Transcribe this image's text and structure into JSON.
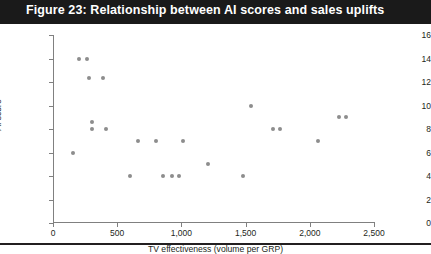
{
  "title": "Figure 23: Relationship between AI scores and sales uplifts",
  "colors": {
    "title_bar": "#1a1a1a",
    "title_text": "#ffffff",
    "point": "#8d8d8d",
    "axis": "#808080",
    "text": "#231f20",
    "rule": "#231f20"
  },
  "chart_data": {
    "type": "scatter",
    "title": "Figure 23: Relationship between AI scores and sales uplifts",
    "xlabel": "TV effectiveness (volume per GRP)",
    "ylabel": "AI score",
    "xlim": [
      0,
      2500
    ],
    "ylim": [
      0,
      16
    ],
    "xticks": [
      0,
      500,
      1000,
      1500,
      2000,
      2500
    ],
    "xtick_labels": [
      "0",
      "500",
      "1,000",
      "1,500",
      "2,000",
      "2,500"
    ],
    "yticks": [
      0,
      2,
      4,
      6,
      8,
      10,
      12,
      14,
      16
    ],
    "ytick_labels": [
      "0",
      "2",
      "4",
      "6",
      "8",
      "10",
      "12",
      "14",
      "16"
    ],
    "grid": false,
    "legend": false,
    "marker": "circle",
    "points": [
      {
        "x": 205,
        "y": 14.0
      },
      {
        "x": 265,
        "y": 14.0
      },
      {
        "x": 280,
        "y": 12.3
      },
      {
        "x": 390,
        "y": 12.3
      },
      {
        "x": 300,
        "y": 8.6
      },
      {
        "x": 300,
        "y": 8.0
      },
      {
        "x": 415,
        "y": 8.0
      },
      {
        "x": 155,
        "y": 6.0
      },
      {
        "x": 600,
        "y": 4.0
      },
      {
        "x": 660,
        "y": 7.0
      },
      {
        "x": 800,
        "y": 7.0
      },
      {
        "x": 860,
        "y": 4.0
      },
      {
        "x": 930,
        "y": 4.0
      },
      {
        "x": 980,
        "y": 4.0
      },
      {
        "x": 1010,
        "y": 7.0
      },
      {
        "x": 1210,
        "y": 5.0
      },
      {
        "x": 1480,
        "y": 4.0
      },
      {
        "x": 1540,
        "y": 10.0
      },
      {
        "x": 1715,
        "y": 8.0
      },
      {
        "x": 1765,
        "y": 8.0
      },
      {
        "x": 2060,
        "y": 7.0
      },
      {
        "x": 2230,
        "y": 9.0
      },
      {
        "x": 2285,
        "y": 9.0
      }
    ]
  }
}
